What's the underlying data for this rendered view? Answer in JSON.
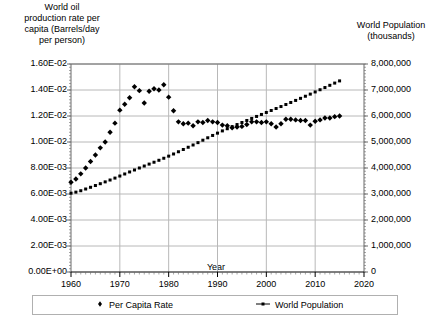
{
  "chart_data": {
    "type": "scatter",
    "title": "",
    "xlabel": "Year",
    "ylabel_left": "World oil production rate per capita (Barrels/day per person)",
    "ylabel_right": "World Population (thousands)",
    "grid": true,
    "legend_position": "bottom",
    "xlim": [
      1960,
      2020
    ],
    "xticks": [
      "1960",
      "1970",
      "1980",
      "1990",
      "2000",
      "2010",
      "2020"
    ],
    "xtick_values": [
      1960,
      1970,
      1980,
      1990,
      2000,
      2010,
      2020
    ],
    "ylim_left": [
      0,
      0.016
    ],
    "yticks_left": [
      "0.00E+00",
      "2.00E-03",
      "4.00E-03",
      "6.00E-03",
      "8.00E-03",
      "1.00E-02",
      "1.20E-02",
      "1.40E-02",
      "1.60E-02"
    ],
    "ytick_values_left": [
      0,
      0.002,
      0.004,
      0.006,
      0.008,
      0.01,
      0.012,
      0.014,
      0.016
    ],
    "ylim_right": [
      0,
      8000000
    ],
    "yticks_right": [
      "0",
      "1,000,000",
      "2,000,000",
      "3,000,000",
      "4,000,000",
      "5,000,000",
      "6,000,000",
      "7,000,000",
      "8,000,000"
    ],
    "ytick_values_right": [
      0,
      1000000,
      2000000,
      3000000,
      4000000,
      5000000,
      6000000,
      7000000,
      8000000
    ],
    "series": [
      {
        "name": "Per Capita Rate",
        "axis": "left",
        "marker": "diamond",
        "color": "#000000",
        "x": [
          1960,
          1961,
          1962,
          1963,
          1964,
          1965,
          1966,
          1967,
          1968,
          1969,
          1970,
          1971,
          1972,
          1973,
          1974,
          1975,
          1976,
          1977,
          1978,
          1979,
          1980,
          1981,
          1982,
          1983,
          1984,
          1985,
          1986,
          1987,
          1988,
          1989,
          1990,
          1991,
          1992,
          1993,
          1994,
          1995,
          1996,
          1997,
          1998,
          1999,
          2000,
          2001,
          2002,
          2003,
          2004,
          2005,
          2006,
          2007,
          2008,
          2009,
          2010,
          2011,
          2012,
          2013,
          2014,
          2015
        ],
        "y": [
          0.0069,
          0.00715,
          0.00755,
          0.008,
          0.0085,
          0.009,
          0.00955,
          0.01,
          0.01075,
          0.01145,
          0.01245,
          0.0129,
          0.0134,
          0.01425,
          0.01395,
          0.013,
          0.0139,
          0.0141,
          0.014,
          0.0144,
          0.01345,
          0.0124,
          0.01155,
          0.0114,
          0.01145,
          0.01125,
          0.01155,
          0.0115,
          0.01165,
          0.01155,
          0.0115,
          0.0113,
          0.01125,
          0.0111,
          0.01115,
          0.0112,
          0.01135,
          0.01155,
          0.01155,
          0.0115,
          0.01155,
          0.0114,
          0.01115,
          0.0114,
          0.01175,
          0.01175,
          0.0117,
          0.01165,
          0.01165,
          0.0113,
          0.0116,
          0.0117,
          0.01185,
          0.01185,
          0.01195,
          0.012
        ]
      },
      {
        "name": "World Population",
        "axis": "right",
        "marker": "small-square",
        "color": "#000000",
        "x": [
          1960,
          1961,
          1962,
          1963,
          1964,
          1965,
          1966,
          1967,
          1968,
          1969,
          1970,
          1971,
          1972,
          1973,
          1974,
          1975,
          1976,
          1977,
          1978,
          1979,
          1980,
          1981,
          1982,
          1983,
          1984,
          1985,
          1986,
          1987,
          1988,
          1989,
          1990,
          1991,
          1992,
          1993,
          1994,
          1995,
          1996,
          1997,
          1998,
          1999,
          2000,
          2001,
          2002,
          2003,
          2004,
          2005,
          2006,
          2007,
          2008,
          2009,
          2010,
          2011,
          2012,
          2013,
          2014,
          2015
        ],
        "y": [
          3032000,
          3072000,
          3126000,
          3192000,
          3258000,
          3326000,
          3396000,
          3466000,
          3538000,
          3612000,
          3691000,
          3770000,
          3848000,
          3924000,
          4000000,
          4076000,
          4150000,
          4222000,
          4297000,
          4375000,
          4456000,
          4539000,
          4625000,
          4712000,
          4798000,
          4885000,
          4975000,
          5069000,
          5162000,
          5252000,
          5341000,
          5427000,
          5510000,
          5591000,
          5671000,
          5750000,
          5828000,
          5906000,
          5983000,
          6060000,
          6136000,
          6212000,
          6288000,
          6364000,
          6442000,
          6520000,
          6599000,
          6679000,
          6760000,
          6842000,
          6925000,
          7010000,
          7095000,
          7180000,
          7266000,
          7350000
        ]
      }
    ]
  },
  "labels": {
    "y_left_title": "World oil\nproduction rate per\ncapita (Barrels/day\nper person)",
    "y_right_title": "World Population\n(thousands)",
    "x_title": "Year"
  },
  "legend": {
    "items": [
      {
        "label": "Per Capita Rate",
        "marker": "diamond"
      },
      {
        "label": "World Population",
        "marker": "line-dot"
      }
    ]
  },
  "colors": {
    "series": "#000000",
    "grid": "#b8b8b8",
    "axis": "#6a6a6a",
    "border": "#b0b0b0",
    "background": "#ffffff"
  }
}
